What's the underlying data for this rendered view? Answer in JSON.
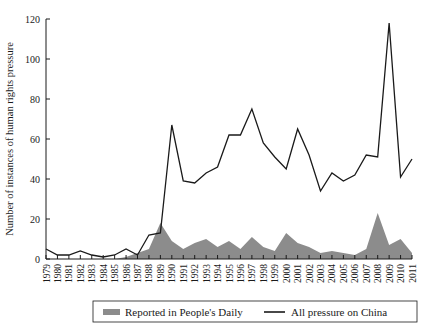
{
  "chart_data": {
    "type": "area",
    "title": "",
    "xlabel": "",
    "ylabel": "Number of instances of human rights pressure",
    "ylim": [
      0,
      120
    ],
    "yticks": [
      0,
      20,
      40,
      60,
      80,
      100,
      120
    ],
    "grid": false,
    "legend_position": "bottom",
    "categories": [
      "1979",
      "1980",
      "1981",
      "1982",
      "1983",
      "1984",
      "1985",
      "1986",
      "1987",
      "1988",
      "1989",
      "1990",
      "1991",
      "1992",
      "1993",
      "1994",
      "1995",
      "1996",
      "1997",
      "1998",
      "1999",
      "2000",
      "2001",
      "2002",
      "2003",
      "2004",
      "2005",
      "2006",
      "2007",
      "2008",
      "2009",
      "2010",
      "2011"
    ],
    "series": [
      {
        "name": "Reported in People's Daily",
        "render": "area",
        "color": "#8c8c8c",
        "values": [
          0,
          0,
          0,
          0,
          0,
          0,
          0,
          1,
          3,
          5,
          18,
          9,
          5,
          8,
          10,
          6,
          9,
          5,
          11,
          6,
          4,
          13,
          8,
          6,
          3,
          4,
          3,
          2,
          5,
          23,
          7,
          10,
          3
        ]
      },
      {
        "name": "All pressure on China",
        "render": "line",
        "color": "#1a1a1a",
        "values": [
          5,
          2,
          2,
          4,
          2,
          1,
          2,
          5,
          2,
          12,
          13,
          67,
          39,
          38,
          43,
          46,
          62,
          62,
          75,
          58,
          51,
          45,
          65,
          52,
          34,
          43,
          39,
          42,
          52,
          51,
          118,
          41,
          50
        ]
      }
    ],
    "legend": [
      {
        "label": "Reported in People's Daily",
        "marker": "swatch",
        "color": "#8c8c8c"
      },
      {
        "label": "All pressure on China",
        "marker": "line",
        "color": "#1a1a1a"
      }
    ]
  }
}
